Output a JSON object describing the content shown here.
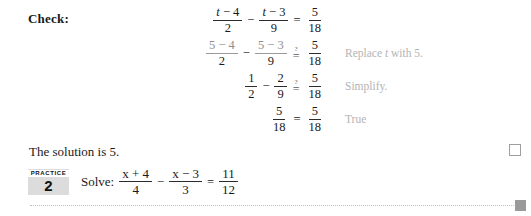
{
  "check": {
    "label": "Check:"
  },
  "rows": [
    {
      "left": {
        "frac1": {
          "num": "t − 4",
          "den": "2",
          "faded": false,
          "italic_var": "t"
        },
        "operator": "−",
        "frac2": {
          "num": "t − 3",
          "den": "9",
          "faded": false,
          "italic_var": "t"
        }
      },
      "relation": "=",
      "right": {
        "num": "5",
        "den": "18"
      },
      "reason": ""
    },
    {
      "left": {
        "frac1": {
          "num": "5 − 4",
          "den": "2",
          "faded": true
        },
        "operator": "−",
        "frac2": {
          "num": "5 − 3",
          "den": "9",
          "faded": true
        }
      },
      "relation": "≟",
      "right": {
        "num": "5",
        "den": "18"
      },
      "reason_pre": "Replace ",
      "reason_var": "t",
      "reason_post": " with 5."
    },
    {
      "left": {
        "frac1": {
          "num": "1",
          "den": "2",
          "faded": false
        },
        "operator": "−",
        "frac2": {
          "num": "2",
          "den": "9",
          "faded": false
        }
      },
      "relation": "≟",
      "right": {
        "num": "5",
        "den": "18"
      },
      "reason": "Simplify."
    },
    {
      "left": {
        "frac1": {
          "num": "5",
          "den": "18",
          "faded": false
        }
      },
      "relation": "=",
      "right": {
        "num": "5",
        "den": "18"
      },
      "reason": "True"
    }
  ],
  "solution": {
    "text": "The solution is 5."
  },
  "practice": {
    "kicker": "PRACTICE",
    "number": "2",
    "prompt_lead": "Solve:",
    "frac1": {
      "num": "x + 4",
      "den": "4"
    },
    "operator": "−",
    "frac2": {
      "num": "x − 3",
      "den": "3"
    },
    "relation": "=",
    "frac3": {
      "num": "11",
      "den": "12"
    }
  },
  "marks": {
    "answer_box": "",
    "end_marker": ""
  },
  "colors": {
    "text": "#1a1a1a",
    "reason_gray": "#b4b4b4",
    "faded_gray": "#8e8e8e",
    "badge_bg": "#dcdcdc",
    "marker_gray": "#9a9a9a"
  }
}
